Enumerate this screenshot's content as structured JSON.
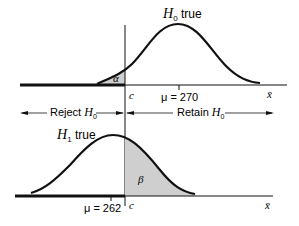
{
  "top_panel": {
    "curve_label_var": "H",
    "curve_label_sub": "0",
    "curve_label_suffix": " true",
    "critical_label": "c",
    "mean_label": "μ = 270",
    "axis_label": "x̄",
    "tail_label": "α"
  },
  "regions": {
    "reject_prefix": "Reject ",
    "reject_var": "H",
    "reject_sub": "0",
    "retain_prefix": "Retain ",
    "retain_var": "H",
    "retain_sub": "0"
  },
  "bottom_panel": {
    "curve_label_var": "H",
    "curve_label_sub": "1",
    "curve_label_suffix": " true",
    "critical_label": "c",
    "mean_label": "μ = 262",
    "axis_label": "x̄",
    "tail_label": "β"
  },
  "colors": {
    "line": "#111111",
    "shade": "#cfcfcf"
  }
}
